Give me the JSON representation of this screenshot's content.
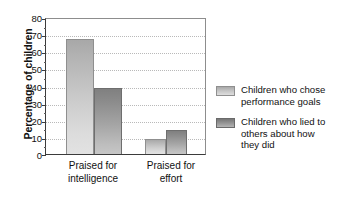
{
  "chart_data": {
    "type": "bar",
    "title": "",
    "xlabel": "",
    "ylabel": "Percentage of children",
    "ylim": [
      0,
      80
    ],
    "ytick_step": 10,
    "yticks": [
      0,
      10,
      20,
      30,
      40,
      50,
      60,
      70,
      80
    ],
    "grid": true,
    "legend_position": "right",
    "categories": [
      "Praised for intelligence",
      "Praised for effort"
    ],
    "category_lines": [
      [
        "Praised for",
        "intelligence"
      ],
      [
        "Praised for",
        "effort"
      ]
    ],
    "series": [
      {
        "name": "Children who chose performance goals",
        "name_lines": [
          "Children who chose",
          "performance goals"
        ],
        "color": "#c6c6c6",
        "values": [
          68,
          9
        ]
      },
      {
        "name": "Children who lied to others about how they did",
        "name_lines": [
          "Children who lied to",
          "others about how",
          "they did"
        ],
        "color": "#949494",
        "values": [
          39,
          14
        ]
      }
    ]
  },
  "axis": {
    "y_title": "Percentage of children",
    "tick_labels": [
      "80",
      "70",
      "60",
      "50",
      "40",
      "30",
      "20",
      "10",
      "0"
    ]
  },
  "legend": {
    "items": [
      {
        "swatch": "light",
        "line1": "Children who chose",
        "line2": "performance goals",
        "line3": ""
      },
      {
        "swatch": "dark",
        "line1": "Children who lied to",
        "line2": "others about how",
        "line3": "they did"
      }
    ]
  },
  "categories": [
    {
      "line1": "Praised for",
      "line2": "intelligence"
    },
    {
      "line1": "Praised for",
      "line2": "effort"
    }
  ]
}
